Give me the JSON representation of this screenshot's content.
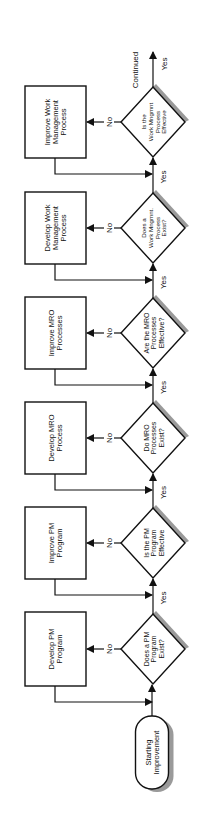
{
  "diagram": {
    "orientation": "rotated-90-ccw",
    "colors": {
      "stroke": "#111111",
      "shadow": "#9a9a9a",
      "background": "#ffffff"
    },
    "start": {
      "label_lines": [
        "Starting",
        "Improvement"
      ]
    },
    "continued_label": "Continued",
    "steps": [
      {
        "decision": [
          "Does a PM",
          "Program",
          "Exist?"
        ],
        "action": [
          "Develop PM",
          "Program"
        ],
        "no_label": "No",
        "yes_label": "Yes"
      },
      {
        "decision": [
          "Is the PM",
          "Program",
          "Effective"
        ],
        "action": [
          "Improve PM",
          "Program"
        ],
        "no_label": "No",
        "yes_label": "Yes"
      },
      {
        "decision": [
          "Do MRO",
          "Processes",
          "Exist?"
        ],
        "action": [
          "Develop MRO",
          "Process"
        ],
        "no_label": "No",
        "yes_label": "Yes"
      },
      {
        "decision": [
          "Are the MRO",
          "Processes",
          "Effective?"
        ],
        "action": [
          "Improve MRO",
          "Processes"
        ],
        "no_label": "No",
        "yes_label": "Yes"
      },
      {
        "decision": [
          "Does a",
          "Work Mngmnt.",
          "Process",
          "Exist?"
        ],
        "action": [
          "Develop Work",
          "Management",
          "Process"
        ],
        "no_label": "No",
        "yes_label": "Yes"
      },
      {
        "decision": [
          "Is the",
          "Work Mngmnt",
          "Process",
          "Effective"
        ],
        "action": [
          "Improve Work",
          "Management",
          "Process"
        ],
        "no_label": "No",
        "yes_label": "Yes"
      }
    ]
  }
}
